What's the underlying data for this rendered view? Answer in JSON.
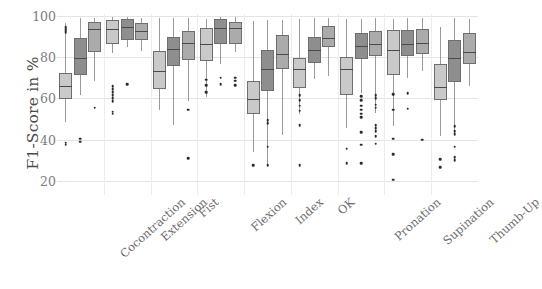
{
  "chart_data": {
    "type": "box",
    "title": "",
    "xlabel": "",
    "ylabel": "F1-Score in %",
    "ylim": [
      15,
      101
    ],
    "yticks": [
      20,
      40,
      60,
      80,
      100
    ],
    "ytick_labels": [
      "20",
      "40",
      "60",
      "80",
      "100"
    ],
    "grid": true,
    "legend": "none",
    "categories": [
      "Cocontraction",
      "Extension",
      "Fist",
      "Flexion",
      "Index",
      "OK",
      "Pronation",
      "Supination",
      "Thumb-Up"
    ],
    "series_colors": [
      "#c9c9c9",
      "#8e8e8e",
      "#ababab"
    ],
    "series": [
      {
        "name": "series-1",
        "color": "#c9c9c9",
        "boxes": [
          {
            "category": "Cocontraction",
            "min": 48.5,
            "q1": 59.5,
            "median": 66.0,
            "q3": 72.5,
            "max": 96.5,
            "outliers": [
              94.5,
              93.8,
              93.0,
              92.2,
              38.5,
              37.5
            ]
          },
          {
            "category": "Extension",
            "min": 82.0,
            "q1": 86.5,
            "median": 93.5,
            "q3": 98.0,
            "max": 99.5,
            "outliers": [
              66.0,
              64.5,
              63.0,
              61.5,
              60.0,
              58.5,
              53.5,
              52.5
            ]
          },
          {
            "category": "Fist",
            "min": 54.5,
            "q1": 64.5,
            "median": 73.5,
            "q3": 83.0,
            "max": 99.0,
            "outliers": []
          },
          {
            "category": "Flexion",
            "min": 60.5,
            "q1": 78.0,
            "median": 86.5,
            "q3": 94.0,
            "max": 98.5,
            "outliers": [
              69.0,
              66.5,
              63.0
            ]
          },
          {
            "category": "Index",
            "min": 34.0,
            "q1": 52.5,
            "median": 59.5,
            "q3": 68.5,
            "max": 97.5,
            "outliers": [
              27.5
            ]
          },
          {
            "category": "OK",
            "min": 52.5,
            "q1": 65.0,
            "median": 74.5,
            "q3": 79.5,
            "max": 98.5,
            "outliers": [
              61.5,
              59.0,
              56.5,
              54.0,
              47.0,
              27.5
            ]
          },
          {
            "category": "Pronation",
            "min": 45.5,
            "q1": 61.5,
            "median": 74.5,
            "q3": 80.0,
            "max": 98.5,
            "outliers": [
              35.5,
              28.5
            ]
          },
          {
            "category": "Supination",
            "min": 46.5,
            "q1": 71.5,
            "median": 83.5,
            "q3": 93.0,
            "max": 98.5,
            "outliers": [
              62.0,
              54.5,
              40.5,
              33.0,
              20.5
            ]
          },
          {
            "category": "Thumb-Up",
            "min": 41.5,
            "q1": 59.0,
            "median": 65.5,
            "q3": 76.5,
            "max": 94.5,
            "outliers": [
              30.5,
              26.5
            ]
          }
        ]
      },
      {
        "name": "series-2",
        "color": "#8e8e8e",
        "boxes": [
          {
            "category": "Cocontraction",
            "min": 61.5,
            "q1": 71.5,
            "median": 79.5,
            "q3": 89.5,
            "max": 99.0,
            "outliers": [
              40.5,
              39.0
            ]
          },
          {
            "category": "Extension",
            "min": 85.0,
            "q1": 88.5,
            "median": 94.5,
            "q3": 98.5,
            "max": 99.5,
            "outliers": [
              67.0
            ]
          },
          {
            "category": "Fist",
            "min": 47.0,
            "q1": 75.5,
            "median": 84.0,
            "q3": 90.0,
            "max": 99.0,
            "outliers": []
          },
          {
            "category": "Flexion",
            "min": 76.5,
            "q1": 86.5,
            "median": 94.0,
            "q3": 98.5,
            "max": 99.5,
            "outliers": [
              70.0,
              67.0
            ]
          },
          {
            "category": "Index",
            "min": 28.0,
            "q1": 63.5,
            "median": 74.5,
            "q3": 83.5,
            "max": 98.0,
            "outliers": [
              49.5,
              48.0,
              36.5,
              27.5
            ]
          },
          {
            "category": "OK",
            "min": 69.5,
            "q1": 77.0,
            "median": 83.5,
            "q3": 90.0,
            "max": 99.0,
            "outliers": []
          },
          {
            "category": "Pronation",
            "min": 62.5,
            "q1": 79.0,
            "median": 85.5,
            "q3": 92.0,
            "max": 98.5,
            "outliers": [
              61.0,
              59.0,
              56.5,
              54.5,
              52.5,
              51.0,
              43.5,
              37.5,
              28.5
            ]
          },
          {
            "category": "Supination",
            "min": 70.0,
            "q1": 80.5,
            "median": 86.5,
            "q3": 93.0,
            "max": 99.0,
            "outliers": [
              62.5,
              55.0
            ]
          },
          {
            "category": "Thumb-Up",
            "min": 42.5,
            "q1": 68.0,
            "median": 79.5,
            "q3": 88.5,
            "max": 99.0,
            "outliers": [
              46.5,
              44.0,
              42.5,
              36.5,
              31.5,
              30.0
            ]
          }
        ]
      },
      {
        "name": "series-3",
        "color": "#ababab",
        "boxes": [
          {
            "category": "Cocontraction",
            "min": 68.5,
            "q1": 82.5,
            "median": 93.5,
            "q3": 97.0,
            "max": 99.0,
            "outliers": [
              55.5
            ]
          },
          {
            "category": "Extension",
            "min": 83.0,
            "q1": 88.5,
            "median": 92.5,
            "q3": 96.5,
            "max": 99.0,
            "outliers": []
          },
          {
            "category": "Fist",
            "min": 58.5,
            "q1": 78.5,
            "median": 87.0,
            "q3": 92.5,
            "max": 99.0,
            "outliers": [
              54.5,
              31.0
            ]
          },
          {
            "category": "Flexion",
            "min": 82.5,
            "q1": 86.5,
            "median": 94.0,
            "q3": 97.0,
            "max": 99.5,
            "outliers": [
              70.0,
              68.5,
              66.5
            ]
          },
          {
            "category": "Index",
            "min": 42.0,
            "q1": 74.5,
            "median": 81.5,
            "q3": 91.0,
            "max": 98.0,
            "outliers": []
          },
          {
            "category": "OK",
            "min": 71.0,
            "q1": 85.0,
            "median": 89.5,
            "q3": 95.0,
            "max": 99.0,
            "outliers": []
          },
          {
            "category": "Pronation",
            "min": 53.0,
            "q1": 80.5,
            "median": 86.5,
            "q3": 92.5,
            "max": 99.0,
            "outliers": [
              61.5,
              60.0,
              57.0,
              55.5,
              47.0,
              45.5,
              44.0,
              41.5,
              38.0
            ]
          },
          {
            "category": "Supination",
            "min": 73.5,
            "q1": 81.5,
            "median": 87.0,
            "q3": 93.5,
            "max": 99.0,
            "outliers": [
              40.0
            ]
          },
          {
            "category": "Thumb-Up",
            "min": 66.0,
            "q1": 76.5,
            "median": 82.5,
            "q3": 92.0,
            "max": 98.5,
            "outliers": []
          }
        ]
      }
    ]
  }
}
